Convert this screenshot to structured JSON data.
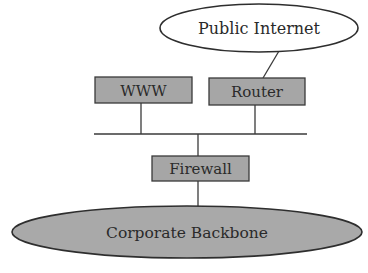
{
  "diagram": {
    "type": "network-topology",
    "nodes": {
      "internet": {
        "label": "Public Internet",
        "shape": "ellipse",
        "fill": "#ffffff"
      },
      "www": {
        "label": "WWW",
        "shape": "box",
        "fill": "#a6a6a6"
      },
      "router": {
        "label": "Router",
        "shape": "box",
        "fill": "#a6a6a6"
      },
      "firewall": {
        "label": "Firewall",
        "shape": "box",
        "fill": "#a6a6a6"
      },
      "backbone": {
        "label": "Corporate Backbone",
        "shape": "ellipse",
        "fill": "#a9a9a9"
      }
    },
    "edges": [
      {
        "from": "router",
        "to": "internet"
      },
      {
        "from": "www",
        "to": "dmz-bus"
      },
      {
        "from": "router",
        "to": "dmz-bus"
      },
      {
        "from": "dmz-bus",
        "to": "firewall"
      },
      {
        "from": "firewall",
        "to": "backbone"
      }
    ]
  }
}
